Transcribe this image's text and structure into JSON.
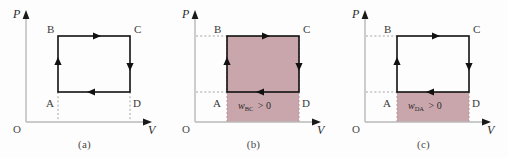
{
  "figure": {
    "type": "pv-diagram-series",
    "background_color": "#fdfdfd",
    "panel_count": 3
  },
  "style": {
    "shade_color": "#c9a6ab",
    "shade_border_color": "#b08f95",
    "cycle_line_color": "#111111",
    "axis_color": "#b8b8b8",
    "axis_arrow_color": "#1a1a1a",
    "dashed_color": "#9a9a9a",
    "text_color": "#3a3a3a"
  },
  "panels": [
    {
      "id": "a",
      "caption": "(a)",
      "axes": {
        "y_label": "P",
        "x_label": "V",
        "origin_label": "O"
      },
      "vertices": [
        {
          "name": "B",
          "label": "B",
          "position": "top-left"
        },
        {
          "name": "C",
          "label": "C",
          "position": "top-right"
        },
        {
          "name": "A",
          "label": "A",
          "position": "bottom-left"
        },
        {
          "name": "D",
          "label": "D",
          "position": "bottom-right"
        }
      ],
      "arrows": [
        {
          "segment": "B-C",
          "direction": "right"
        },
        {
          "segment": "C-D",
          "direction": "down"
        },
        {
          "segment": "D-A",
          "direction": "left"
        },
        {
          "segment": "A-B",
          "direction": "up"
        }
      ],
      "shaded": false,
      "work_label": null
    },
    {
      "id": "b",
      "caption": "(b)",
      "axes": {
        "y_label": "P",
        "x_label": "V",
        "origin_label": "O"
      },
      "vertices": [
        {
          "name": "B",
          "label": "B",
          "position": "top-left"
        },
        {
          "name": "C",
          "label": "C",
          "position": "top-right"
        },
        {
          "name": "A",
          "label": "A",
          "position": "bottom-left"
        },
        {
          "name": "D",
          "label": "D",
          "position": "bottom-right"
        }
      ],
      "arrows": [
        {
          "segment": "B-C",
          "direction": "right"
        },
        {
          "segment": "C-D",
          "direction": "down"
        },
        {
          "segment": "D-A",
          "direction": "left"
        },
        {
          "segment": "A-B",
          "direction": "up"
        }
      ],
      "shaded": true,
      "shade_region": "under-BC-line-to-V-axis",
      "work_label": {
        "symbol": "w",
        "subscript": "BC",
        "relation": "> 0",
        "full_text": "wBC > 0"
      }
    },
    {
      "id": "c",
      "caption": "(c)",
      "axes": {
        "y_label": "P",
        "x_label": "V",
        "origin_label": "O"
      },
      "vertices": [
        {
          "name": "B",
          "label": "B",
          "position": "top-left"
        },
        {
          "name": "C",
          "label": "C",
          "position": "top-right"
        },
        {
          "name": "A",
          "label": "A",
          "position": "bottom-left"
        },
        {
          "name": "D",
          "label": "D",
          "position": "bottom-right"
        }
      ],
      "arrows": [
        {
          "segment": "B-C",
          "direction": "right"
        },
        {
          "segment": "C-D",
          "direction": "down"
        },
        {
          "segment": "D-A",
          "direction": "left"
        },
        {
          "segment": "A-B",
          "direction": "up"
        }
      ],
      "shaded": true,
      "shade_region": "under-DA-line-to-V-axis",
      "work_label": {
        "symbol": "w",
        "subscript": "DA",
        "relation": "> 0",
        "full_text": "wDA > 0"
      }
    }
  ]
}
